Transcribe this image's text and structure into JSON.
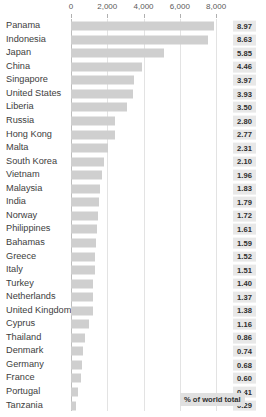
{
  "clipped_header": "",
  "legend": {
    "label": "% of world total"
  },
  "axis": {
    "ticks": [
      "0",
      "2,000",
      "4,000",
      "6,000",
      "8,000"
    ],
    "tick_values": [
      0,
      2000,
      4000,
      6000,
      8000
    ]
  },
  "colors": {
    "bar": "#cfcfcf",
    "value_box": "#e8e8e8",
    "gridline": "#e3e3e3",
    "axis": "#bdbdbd",
    "label_text": "#3d3d3d"
  },
  "chart_data": {
    "type": "bar",
    "title": "",
    "subtitle": "",
    "xlabel": "",
    "ylabel": "",
    "orientation": "horizontal",
    "xlim": [
      0,
      8600
    ],
    "grid": true,
    "legend_position": "bottom-right",
    "legend_entries": [
      "% of world total"
    ],
    "categories": [
      "Panama",
      "Indonesia",
      "Japan",
      "China",
      "Singapore",
      "United States",
      "Liberia",
      "Russia",
      "Hong Kong",
      "Malta",
      "South Korea",
      "Vietnam",
      "Malaysia",
      "India",
      "Norway",
      "Philippines",
      "Bahamas",
      "Greece",
      "Italy",
      "Turkey",
      "Netherlands",
      "United Kingdom",
      "Cyprus",
      "Thailand",
      "Denmark",
      "Germany",
      "France",
      "Portugal",
      "Tanzania"
    ],
    "series": [
      {
        "name": "Number of vessels",
        "values": [
          7860,
          7560,
          5125,
          3905,
          3480,
          3440,
          3065,
          2450,
          2425,
          2025,
          1840,
          1715,
          1605,
          1570,
          1505,
          1410,
          1395,
          1330,
          1325,
          1225,
          1210,
          1200,
          1015,
          755,
          650,
          595,
          525,
          360,
          255
        ]
      },
      {
        "name": "% of world total",
        "values": [
          "8.97",
          "8.63",
          "5.85",
          "4.46",
          "3.97",
          "3.93",
          "3.50",
          "2.80",
          "2.77",
          "2.31",
          "2.10",
          "1.96",
          "1.83",
          "1.79",
          "1.72",
          "1.61",
          "1.59",
          "1.52",
          "1.51",
          "1.40",
          "1.37",
          "1.38",
          "1.16",
          "0.86",
          "0.74",
          "0.68",
          "0.60",
          "0.41",
          "0.29"
        ]
      }
    ]
  }
}
